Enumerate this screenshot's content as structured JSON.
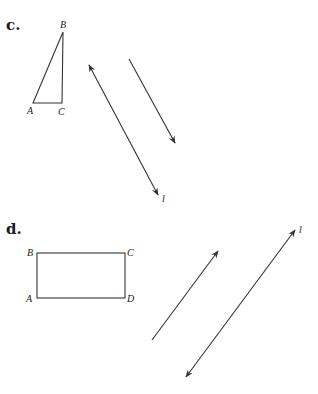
{
  "parts": [
    {
      "label": "c.",
      "figure": {
        "type": "triangle",
        "vertices": {
          "A": {
            "label": "A",
            "x": 33,
            "y": 103
          },
          "B": {
            "label": "B",
            "x": 63,
            "y": 32
          },
          "C": {
            "label": "C",
            "x": 62,
            "y": 103
          }
        }
      },
      "line": {
        "label": "l",
        "from": [
          89,
          65
        ],
        "to": [
          158,
          195
        ],
        "arrows": "both"
      },
      "vector": {
        "from": [
          129,
          59
        ],
        "to": [
          175,
          143
        ],
        "arrows": "end"
      }
    },
    {
      "label": "d.",
      "figure": {
        "type": "rectangle",
        "vertices": {
          "A": {
            "label": "A",
            "x": 37,
            "y": 298
          },
          "B": {
            "label": "B",
            "x": 37,
            "y": 253
          },
          "C": {
            "label": "C",
            "x": 125,
            "y": 253
          },
          "D": {
            "label": "D",
            "x": 125,
            "y": 298
          }
        }
      },
      "line": {
        "label": "l",
        "from": [
          186,
          377
        ],
        "to": [
          295,
          230
        ],
        "arrows": "both"
      },
      "vector": {
        "from": [
          152,
          340
        ],
        "to": [
          218,
          251
        ],
        "arrows": "end"
      }
    }
  ]
}
